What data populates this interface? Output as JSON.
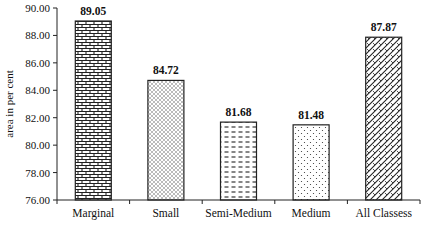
{
  "chart_data": {
    "type": "bar",
    "title": "",
    "xlabel": "",
    "ylabel": "area in per cent",
    "categories": [
      "Marginal",
      "Small",
      "Semi-Medium",
      "Medium",
      "All Classess"
    ],
    "values": [
      89.05,
      84.72,
      81.68,
      81.48,
      87.87
    ],
    "value_labels": [
      "89.05",
      "84.72",
      "81.68",
      "81.48",
      "87.87"
    ],
    "patterns": [
      "brick",
      "crosshatch-dots",
      "dashes",
      "dots",
      "diagonal-weave"
    ],
    "ylim": [
      76.0,
      90.0
    ],
    "yticks": [
      "76.00",
      "78.00",
      "80.00",
      "82.00",
      "84.00",
      "86.00",
      "88.00",
      "90.00"
    ],
    "grid": false,
    "legend": null
  }
}
